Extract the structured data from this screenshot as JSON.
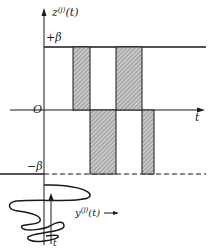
{
  "diagram": {
    "y_axis_label": "z",
    "y_axis_label_sup": "(j)",
    "y_axis_label_arg": "(t)",
    "x_axis_label": "t",
    "origin_label": "O",
    "upper_level_label": "+β",
    "lower_level_label": "−β",
    "input_signal_label": "y",
    "input_signal_label_sup": "(j)",
    "input_signal_label_arg": "(t)",
    "input_time_label": "t",
    "colors": {
      "ink": "#1a1a1a",
      "hatch_fill": "#a9a9a9"
    }
  }
}
